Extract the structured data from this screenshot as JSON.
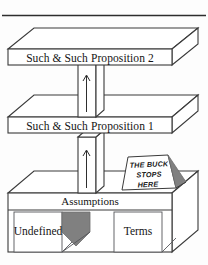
{
  "figure": {
    "rule": {
      "name": "top-horizontal-rule"
    },
    "slabs": [
      {
        "id": "proposition-2",
        "label": "Such & Such Proposition 2"
      },
      {
        "id": "proposition-1",
        "label": "Such & Such Proposition 1"
      }
    ],
    "base": {
      "top_label": "Assumptions",
      "left_label": "Undefined",
      "right_label": "Terms"
    },
    "sign": {
      "line1": "THE BUCK",
      "line2": "STOPS",
      "line3": "HERE"
    },
    "pillars": [
      {
        "id": "pillar-upper",
        "arrow": "up-arrow"
      },
      {
        "id": "pillar-lower",
        "arrow": "up-arrow"
      }
    ],
    "colors": {
      "stroke": "#3a3a3a",
      "face": "#ffffff",
      "shade": "#808080",
      "shade_dark": "#707070",
      "background": "#fdfdfd",
      "text": "#141414"
    }
  }
}
